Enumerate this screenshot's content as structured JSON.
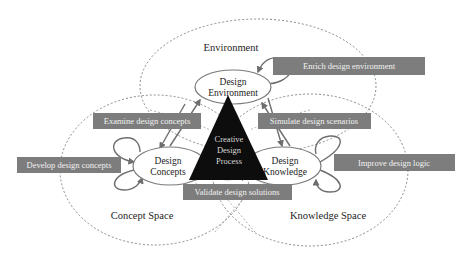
{
  "diagram": {
    "colors": {
      "background": "#ffffff",
      "dashed_circle": "#8a8a8a",
      "node_stroke": "#7a7a7a",
      "label_box": "#7d7d7d",
      "label_text": "#f2f2f2",
      "triangle": "#0d0d0d",
      "triangle_text": "#cfcfcf",
      "arrow": "#6e6e6e"
    },
    "spaces": {
      "environment": "Environment",
      "concept": "Concept Space",
      "knowledge": "Knowledge Space"
    },
    "nodes": {
      "environment": {
        "line1": "Design",
        "line2": "Environment"
      },
      "concepts": {
        "line1": "Design",
        "line2": "Concepts"
      },
      "knowledge": {
        "line1": "Design",
        "line2": "Knowledge"
      }
    },
    "center": {
      "line1": "Creative",
      "line2": "Design",
      "line3": "Process"
    },
    "actions": {
      "enrich": "Enrich design environment",
      "examine": "Examine design concepts",
      "simulate": "Simulate design scenarios",
      "develop": "Develop design concepts",
      "improve": "Improve design logic",
      "validate": "Validate design solutions"
    }
  }
}
